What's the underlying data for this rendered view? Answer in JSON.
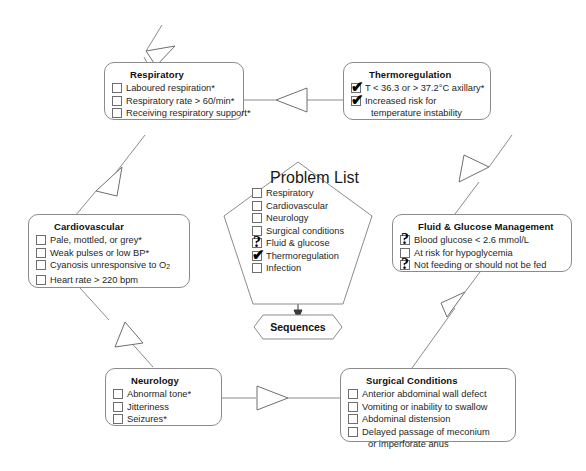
{
  "diagram": {
    "line_color": "#8b8b8b",
    "text_color": "#262626",
    "background": "#ffffff"
  },
  "nodes": {
    "respiratory": {
      "title": "Respiratory",
      "items": [
        {
          "label": "Laboured respiration*",
          "state": "unchecked"
        },
        {
          "label": "Respiratory rate > 60/min*",
          "state": "unchecked"
        },
        {
          "label": "Receiving respiratory support*",
          "state": "unchecked"
        }
      ]
    },
    "thermoregulation": {
      "title": "Thermoregulation",
      "items": [
        {
          "label": "T < 36.3 or > 37.2°C axillary*",
          "state": "checked"
        },
        {
          "label": "Increased risk for",
          "state": "checked"
        },
        {
          "label": "temperature instability",
          "state": "continuation"
        }
      ]
    },
    "cardiovascular": {
      "title": "Cardiovascular",
      "items": [
        {
          "label": "Pale, mottled, or grey*",
          "state": "unchecked"
        },
        {
          "label": "Weak pulses or low BP*",
          "state": "unchecked"
        },
        {
          "label": "Cyanosis unresponsive to O",
          "sub": "2",
          "state": "unchecked"
        },
        {
          "label": "Heart rate > 220 bpm",
          "state": "unchecked"
        }
      ]
    },
    "fluid_glucose": {
      "title": "Fluid & Glucose Management",
      "items": [
        {
          "label": "Blood glucose < 2.6 mmol/L",
          "state": "question"
        },
        {
          "label": "At risk for hypoglycemia",
          "state": "unchecked"
        },
        {
          "label": "Not feeding or should not be fed",
          "state": "question"
        }
      ]
    },
    "neurology": {
      "title": "Neurology",
      "items": [
        {
          "label": "Abnormal tone*",
          "state": "unchecked"
        },
        {
          "label": "Jitteriness",
          "state": "unchecked"
        },
        {
          "label": "Seizures*",
          "state": "unchecked"
        }
      ]
    },
    "surgical_conditions": {
      "title": "Surgical Conditions",
      "items": [
        {
          "label": "Anterior abdominal wall defect",
          "state": "unchecked"
        },
        {
          "label": "Vomiting or inability to swallow",
          "state": "unchecked"
        },
        {
          "label": "Abdominal distension",
          "state": "unchecked"
        },
        {
          "label": "Delayed passage of meconium",
          "state": "unchecked"
        },
        {
          "label": "or imperforate anus",
          "state": "continuation"
        }
      ]
    },
    "problem_list": {
      "title": "Problem List",
      "items": [
        {
          "label": "Respiratory",
          "state": "unchecked"
        },
        {
          "label": "Cardiovascular",
          "state": "unchecked"
        },
        {
          "label": "Neurology",
          "state": "unchecked"
        },
        {
          "label": "Surgical conditions",
          "state": "unchecked"
        },
        {
          "label": "Fluid & glucose",
          "state": "question"
        },
        {
          "label": "Thermoregulation",
          "state": "checked"
        },
        {
          "label": "Infection",
          "state": "unchecked"
        }
      ]
    },
    "sequences": {
      "label": "Sequences"
    }
  },
  "marks": {
    "checked": "✔",
    "question": "?",
    "unchecked": ""
  },
  "connectors": [
    {
      "name": "entry-to-respiratory",
      "from": "top-entry",
      "to": "respiratory",
      "arrow": "hollow-triangle"
    },
    {
      "name": "thermoregulation-to-respiratory",
      "from": "thermoregulation",
      "to": "respiratory",
      "arrow": "hollow-triangle"
    },
    {
      "name": "respiratory-to-cardiovascular",
      "from": "respiratory",
      "to": "cardiovascular",
      "arrow": "hollow-triangle"
    },
    {
      "name": "cardiovascular-to-neurology",
      "from": "cardiovascular",
      "to": "neurology",
      "arrow": "hollow-triangle"
    },
    {
      "name": "neurology-to-surgical-conditions",
      "from": "neurology",
      "to": "surgical_conditions",
      "arrow": "hollow-triangle"
    },
    {
      "name": "surgical-conditions-to-fluid-glucose",
      "from": "surgical_conditions",
      "to": "fluid_glucose",
      "arrow": "hollow-triangle"
    },
    {
      "name": "fluid-glucose-to-thermoregulation",
      "from": "fluid_glucose",
      "to": "thermoregulation",
      "arrow": "hollow-triangle"
    },
    {
      "name": "problem-list-to-sequences",
      "from": "problem_list",
      "to": "sequences",
      "arrow": "solid-arrow"
    }
  ]
}
